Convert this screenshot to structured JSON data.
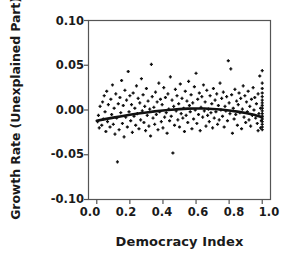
{
  "chart_data": {
    "type": "scatter",
    "title": "",
    "xlabel": "Democracy Index",
    "ylabel": "Growth Rate (Unexplained Part)",
    "xlim": [
      -0.05,
      1.05
    ],
    "ylim": [
      -0.1,
      0.1
    ],
    "xticks": [
      "0.0",
      "0.2",
      "0.4",
      "0.6",
      "0.8",
      "1.0"
    ],
    "xtick_values": [
      0.0,
      0.2,
      0.4,
      0.6,
      0.8,
      1.0
    ],
    "yticks": [
      "0.10",
      "0.05",
      "0.00",
      "-0.05",
      "-0.10"
    ],
    "ytick_values": [
      0.1,
      0.05,
      0.0,
      -0.05,
      -0.1
    ],
    "grid": false,
    "legend": null,
    "marker": "plus",
    "marker_color": "#111111",
    "frame_color": "#444444",
    "series": [
      {
        "name": "Residual growth vs democracy",
        "points": [
          [
            0.005,
            -0.013
          ],
          [
            0.01,
            -0.006
          ],
          [
            0.015,
            -0.02
          ],
          [
            0.02,
            0.004
          ],
          [
            0.03,
            -0.017
          ],
          [
            0.035,
            0.009
          ],
          [
            0.04,
            -0.01
          ],
          [
            0.045,
            0.016
          ],
          [
            0.05,
            -0.002
          ],
          [
            0.055,
            -0.024
          ],
          [
            0.06,
            0.021
          ],
          [
            0.065,
            -0.013
          ],
          [
            0.07,
            0.006
          ],
          [
            0.08,
            -0.019
          ],
          [
            0.085,
            0.012
          ],
          [
            0.09,
            -0.005
          ],
          [
            0.095,
            0.028
          ],
          [
            0.1,
            -0.016
          ],
          [
            0.105,
            0.002
          ],
          [
            0.11,
            -0.027
          ],
          [
            0.115,
            0.018
          ],
          [
            0.12,
            -0.009
          ],
          [
            0.125,
            -0.058
          ],
          [
            0.13,
            0.007
          ],
          [
            0.135,
            -0.022
          ],
          [
            0.14,
            0.014
          ],
          [
            0.145,
            -0.003
          ],
          [
            0.15,
            0.033
          ],
          [
            0.155,
            -0.015
          ],
          [
            0.16,
            0.005
          ],
          [
            0.165,
            -0.03
          ],
          [
            0.17,
            0.022
          ],
          [
            0.175,
            -0.008
          ],
          [
            0.18,
            0.011
          ],
          [
            0.185,
            -0.019
          ],
          [
            0.19,
            0.043
          ],
          [
            0.195,
            -0.002
          ],
          [
            0.2,
            0.016
          ],
          [
            0.205,
            -0.012
          ],
          [
            0.21,
            0.006
          ],
          [
            0.215,
            -0.025
          ],
          [
            0.22,
            0.019
          ],
          [
            0.225,
            -0.007
          ],
          [
            0.23,
            0.002
          ],
          [
            0.235,
            -0.017
          ],
          [
            0.24,
            0.027
          ],
          [
            0.245,
            -0.004
          ],
          [
            0.25,
            0.013
          ],
          [
            0.255,
            -0.021
          ],
          [
            0.26,
            0.008
          ],
          [
            0.265,
            -0.011
          ],
          [
            0.27,
            0.035
          ],
          [
            0.275,
            -0.001
          ],
          [
            0.28,
            0.017
          ],
          [
            0.285,
            -0.014
          ],
          [
            0.29,
            0.004
          ],
          [
            0.295,
            -0.023
          ],
          [
            0.3,
            0.024
          ],
          [
            0.305,
            -0.006
          ],
          [
            0.31,
            0.01
          ],
          [
            0.315,
            -0.018
          ],
          [
            0.32,
            0.001
          ],
          [
            0.325,
            -0.029
          ],
          [
            0.33,
            0.051
          ],
          [
            0.335,
            0.015
          ],
          [
            0.34,
            -0.009
          ],
          [
            0.345,
            0.003
          ],
          [
            0.35,
            -0.016
          ],
          [
            0.355,
            0.02
          ],
          [
            0.36,
            -0.005
          ],
          [
            0.365,
            0.009
          ],
          [
            0.37,
            -0.022
          ],
          [
            0.375,
            0.03
          ],
          [
            0.38,
            -0.002
          ],
          [
            0.385,
            0.012
          ],
          [
            0.39,
            -0.013
          ],
          [
            0.395,
            0.006
          ],
          [
            0.4,
            -0.02
          ],
          [
            0.405,
            0.025
          ],
          [
            0.41,
            -0.008
          ],
          [
            0.415,
            0.014
          ],
          [
            0.42,
            -0.003
          ],
          [
            0.425,
            -0.026
          ],
          [
            0.43,
            0.018
          ],
          [
            0.435,
            0.001
          ],
          [
            0.44,
            -0.012
          ],
          [
            0.445,
            0.037
          ],
          [
            0.45,
            -0.007
          ],
          [
            0.455,
            0.011
          ],
          [
            0.46,
            -0.048
          ],
          [
            0.465,
            0.004
          ],
          [
            0.47,
            -0.017
          ],
          [
            0.475,
            0.023
          ],
          [
            0.48,
            -0.001
          ],
          [
            0.485,
            0.016
          ],
          [
            0.49,
            -0.011
          ],
          [
            0.495,
            0.007
          ],
          [
            0.5,
            -0.019
          ],
          [
            0.505,
            0.029
          ],
          [
            0.51,
            -0.004
          ],
          [
            0.515,
            0.013
          ],
          [
            0.52,
            -0.009
          ],
          [
            0.525,
            0.002
          ],
          [
            0.53,
            -0.024
          ],
          [
            0.535,
            0.021
          ],
          [
            0.54,
            -0.006
          ],
          [
            0.545,
            0.01
          ],
          [
            0.55,
            -0.014
          ],
          [
            0.555,
            0.032
          ],
          [
            0.56,
            0.005
          ],
          [
            0.565,
            -0.002
          ],
          [
            0.57,
            0.017
          ],
          [
            0.575,
            -0.021
          ],
          [
            0.58,
            0.008
          ],
          [
            0.585,
            -0.01
          ],
          [
            0.59,
            0.026
          ],
          [
            0.595,
            0.0
          ],
          [
            0.6,
            0.041
          ],
          [
            0.605,
            -0.015
          ],
          [
            0.61,
            0.012
          ],
          [
            0.615,
            -0.005
          ],
          [
            0.62,
            0.019
          ],
          [
            0.625,
            -0.023
          ],
          [
            0.63,
            0.003
          ],
          [
            0.635,
            0.015
          ],
          [
            0.64,
            -0.008
          ],
          [
            0.645,
            0.028
          ],
          [
            0.65,
            -0.001
          ],
          [
            0.655,
            0.009
          ],
          [
            0.66,
            -0.018
          ],
          [
            0.665,
            0.022
          ],
          [
            0.67,
            -0.006
          ],
          [
            0.675,
            0.001
          ],
          [
            0.68,
            -0.013
          ],
          [
            0.685,
            0.016
          ],
          [
            0.69,
            -0.003
          ],
          [
            0.695,
            0.007
          ],
          [
            0.7,
            -0.02
          ],
          [
            0.705,
            0.024
          ],
          [
            0.71,
            -0.009
          ],
          [
            0.715,
            0.011
          ],
          [
            0.72,
            -0.002
          ],
          [
            0.725,
            0.018
          ],
          [
            0.73,
            -0.016
          ],
          [
            0.735,
            0.005
          ],
          [
            0.74,
            -0.011
          ],
          [
            0.745,
            0.03
          ],
          [
            0.75,
            0.0
          ],
          [
            0.755,
            0.013
          ],
          [
            0.76,
            -0.007
          ],
          [
            0.765,
            0.02
          ],
          [
            0.77,
            -0.019
          ],
          [
            0.775,
            0.004
          ],
          [
            0.78,
            -0.001
          ],
          [
            0.785,
            0.015
          ],
          [
            0.79,
            -0.012
          ],
          [
            0.795,
            0.055
          ],
          [
            0.8,
            0.008
          ],
          [
            0.805,
            -0.004
          ],
          [
            0.81,
            0.046
          ],
          [
            0.815,
            0.017
          ],
          [
            0.82,
            -0.026
          ],
          [
            0.825,
            0.002
          ],
          [
            0.83,
            -0.01
          ],
          [
            0.835,
            0.023
          ],
          [
            0.84,
            -0.005
          ],
          [
            0.845,
            0.01
          ],
          [
            0.85,
            -0.017
          ],
          [
            0.855,
            0.006
          ],
          [
            0.86,
            0.019
          ],
          [
            0.865,
            -0.003
          ],
          [
            0.87,
            0.013
          ],
          [
            0.875,
            -0.021
          ],
          [
            0.88,
            0.001
          ],
          [
            0.885,
            0.027
          ],
          [
            0.89,
            -0.008
          ],
          [
            0.895,
            0.016
          ],
          [
            0.9,
            -0.014
          ],
          [
            0.905,
            0.009
          ],
          [
            0.91,
            -0.002
          ],
          [
            0.915,
            0.021
          ],
          [
            0.92,
            -0.011
          ],
          [
            0.925,
            0.004
          ],
          [
            0.93,
            -0.018
          ],
          [
            0.935,
            0.012
          ],
          [
            0.94,
            -0.006
          ],
          [
            0.945,
            0.025
          ],
          [
            0.95,
            0.0
          ],
          [
            0.955,
            0.014
          ],
          [
            0.96,
            -0.009
          ],
          [
            0.965,
            0.007
          ],
          [
            0.97,
            -0.015
          ],
          [
            0.975,
            0.018
          ],
          [
            0.98,
            -0.004
          ],
          [
            0.985,
            0.038
          ],
          [
            0.99,
            0.002
          ],
          [
            0.995,
            -0.012
          ],
          [
            1.0,
            0.03
          ],
          [
            1.0,
            0.024
          ],
          [
            1.0,
            0.019
          ],
          [
            1.0,
            0.015
          ],
          [
            1.0,
            0.011
          ],
          [
            1.0,
            0.008
          ],
          [
            1.0,
            0.005
          ],
          [
            1.0,
            0.002
          ],
          [
            1.0,
            -0.001
          ],
          [
            1.0,
            -0.004
          ],
          [
            1.0,
            -0.007
          ],
          [
            1.0,
            -0.01
          ],
          [
            1.0,
            -0.013
          ],
          [
            1.0,
            -0.016
          ],
          [
            1.0,
            -0.019
          ],
          [
            1.0,
            -0.022
          ],
          [
            1.0,
            0.044
          ],
          [
            0.99,
            -0.02
          ],
          [
            0.975,
            -0.023
          ]
        ]
      }
    ],
    "fit_line": {
      "name": "Quadratic fit (inverted U)",
      "shape": "concave",
      "points": [
        [
          0.0,
          -0.012
        ],
        [
          0.05,
          -0.0102
        ],
        [
          0.1,
          -0.0085
        ],
        [
          0.15,
          -0.0069
        ],
        [
          0.2,
          -0.0054
        ],
        [
          0.25,
          -0.004
        ],
        [
          0.3,
          -0.0027
        ],
        [
          0.35,
          -0.0015
        ],
        [
          0.4,
          -0.0005
        ],
        [
          0.45,
          0.0003
        ],
        [
          0.5,
          0.001
        ],
        [
          0.55,
          0.0015
        ],
        [
          0.6,
          0.0017
        ],
        [
          0.65,
          0.0016
        ],
        [
          0.7,
          0.0012
        ],
        [
          0.75,
          0.0005
        ],
        [
          0.8,
          -0.0005
        ],
        [
          0.85,
          -0.0018
        ],
        [
          0.9,
          -0.0034
        ],
        [
          0.95,
          -0.0053
        ],
        [
          1.0,
          -0.008
        ]
      ]
    }
  }
}
